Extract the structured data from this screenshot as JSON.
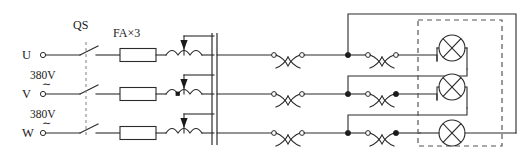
{
  "diagram": {
    "type": "electrical-schematic",
    "width": 530,
    "height": 164,
    "background_color": "#ffffff",
    "line_color": "#2b2b2b",
    "linkage_color": "#8a8a8a",
    "enclosure_color": "#555555"
  },
  "labels": {
    "switch_designator": "QS",
    "fuse_designator": "FA×3",
    "phase_u": "U",
    "phase_v": "V",
    "phase_w": "W",
    "voltage_uv": "380V",
    "voltage_vw": "380V",
    "ac_symbol_1": "∼",
    "ac_symbol_2": "∼"
  },
  "phases": [
    {
      "name": "U",
      "row_y": 55,
      "voltage_below": "380V"
    },
    {
      "name": "V",
      "row_y": 94,
      "voltage_below": "380V"
    },
    {
      "name": "W",
      "row_y": 133,
      "voltage_below": ""
    }
  ],
  "components": {
    "disconnect_switch": {
      "name": "QS",
      "type": "3-pole-knife-switch",
      "poles": 3,
      "ganged": true,
      "linkage_x": 86
    },
    "fuses": {
      "name": "FA×3",
      "type": "fuse",
      "count": 3,
      "width": 36,
      "height": 13
    },
    "chokes": {
      "type": "tapped-inductor",
      "count": 3,
      "humps": 3,
      "has_tap_arrow": true
    },
    "bus_bar": {
      "type": "vertical-bus",
      "x": 214,
      "double_line": true
    },
    "contacts": {
      "type": "changeover-contact",
      "count_per_row": 2,
      "rows": 3,
      "total": 6
    },
    "lamps": {
      "type": "lamp",
      "symbol": "circle-with-cross",
      "count": 3,
      "radius": 13,
      "enclosed_in_dashed_box": true
    },
    "enclosure": {
      "type": "dashed-boundary",
      "x": 418,
      "y": 20,
      "width": 84,
      "height": 126
    }
  }
}
